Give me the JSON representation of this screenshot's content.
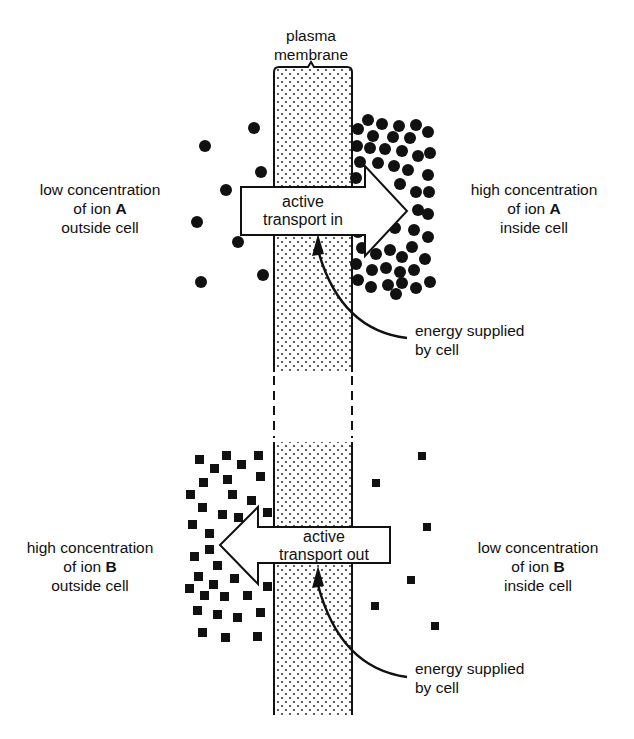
{
  "membrane": {
    "label_line1": "plasma",
    "label_line2": "membrane"
  },
  "ion_a": {
    "outside": {
      "line1": "low concentration",
      "line2_prefix": "of ion ",
      "ion": "A",
      "line3": "outside cell"
    },
    "inside": {
      "line1": "high concentration",
      "line2_prefix": "of ion ",
      "ion": "A",
      "line3": "inside cell"
    },
    "arrow": {
      "line1": "active",
      "line2": "transport in",
      "direction": "right"
    },
    "energy": {
      "line1": "energy supplied",
      "line2": "by cell"
    },
    "marker_shape": "circle",
    "outside_count": 9,
    "inside_count": 48
  },
  "ion_b": {
    "outside": {
      "line1": "high concentration",
      "line2_prefix": "of ion ",
      "ion": "B",
      "line3": "outside cell"
    },
    "inside": {
      "line1": "low concentration",
      "line2_prefix": "of ion ",
      "ion": "B",
      "line3": "inside cell"
    },
    "arrow": {
      "line1": "active",
      "line2": "transport out",
      "direction": "left"
    },
    "energy": {
      "line1": "energy supplied",
      "line2": "by cell"
    },
    "marker_shape": "square",
    "outside_count": 40,
    "inside_count": 7
  },
  "colors": {
    "ink": "#111111",
    "background": "#ffffff"
  }
}
